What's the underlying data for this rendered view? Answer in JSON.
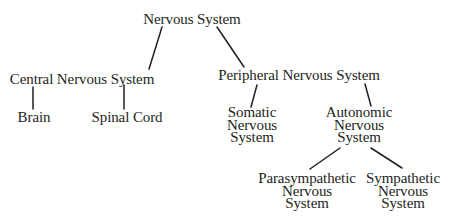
{
  "diagram": {
    "title": "Nervous System",
    "nodes": {
      "root": {
        "lines": [
          "Nervous System"
        ]
      },
      "central": {
        "lines": [
          "Central Nervous System"
        ]
      },
      "peripheral": {
        "lines": [
          "Peripheral Nervous System"
        ]
      },
      "brain": {
        "lines": [
          "Brain"
        ]
      },
      "spinal": {
        "lines": [
          "Spinal Cord"
        ]
      },
      "somatic": {
        "lines": [
          "Somatic",
          "Nervous",
          "System"
        ]
      },
      "autonomic": {
        "lines": [
          "Autonomic",
          "Nervous",
          "System"
        ]
      },
      "parasympathetic": {
        "lines": [
          "Parasympathetic",
          "Nervous",
          "System"
        ]
      },
      "sympathetic": {
        "lines": [
          "Sympathetic",
          "Nervous",
          "System"
        ]
      }
    },
    "edges": [
      {
        "from": "Nervous System",
        "to": "Central Nervous System"
      },
      {
        "from": "Nervous System",
        "to": "Peripheral Nervous System"
      },
      {
        "from": "Central Nervous System",
        "to": "Brain"
      },
      {
        "from": "Central Nervous System",
        "to": "Spinal Cord"
      },
      {
        "from": "Peripheral Nervous System",
        "to": "Somatic Nervous System"
      },
      {
        "from": "Peripheral Nervous System",
        "to": "Autonomic Nervous System"
      },
      {
        "from": "Autonomic Nervous System",
        "to": "Parasympathetic Nervous System"
      },
      {
        "from": "Autonomic Nervous System",
        "to": "Sympathetic Nervous System"
      }
    ],
    "colors": {
      "line": "#231f20",
      "text": "#231f20",
      "background": "#ffffff"
    }
  }
}
